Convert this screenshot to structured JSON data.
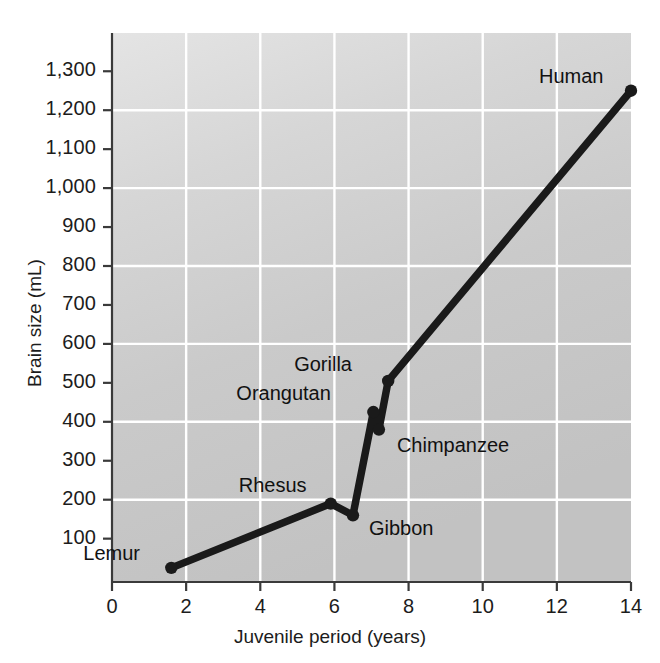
{
  "chart_data": {
    "type": "line",
    "title": "",
    "xlabel": "Juvenile period (years)",
    "ylabel": "Brain size (mL)",
    "xlim": [
      0,
      14
    ],
    "ylim": [
      0,
      1340
    ],
    "xticks": [
      0,
      2,
      4,
      6,
      8,
      10,
      12,
      14
    ],
    "xtick_labels": [
      "0",
      "2",
      "4",
      "6",
      "8",
      "10",
      "12",
      "14"
    ],
    "yticks": [
      100,
      200,
      300,
      400,
      500,
      600,
      700,
      800,
      900,
      1000,
      1100,
      1200,
      1300
    ],
    "ytick_labels": [
      "100",
      "200",
      "300",
      "400",
      "500",
      "600",
      "700",
      "800",
      "900",
      "1,000",
      "1,100",
      "1,200",
      "1,300"
    ],
    "grid": true,
    "grid_color": "#ffffff",
    "plot_background": "#c9c9c9",
    "line_color": "#1a1a1a",
    "marker_color": "#1a1a1a",
    "legend": "none",
    "points": [
      {
        "name": "Lemur",
        "x": 1.6,
        "y": 25,
        "label_dx": -88,
        "label_dy": -26
      },
      {
        "name": "Rhesus",
        "x": 5.9,
        "y": 190,
        "label_dx": -92,
        "label_dy": -30
      },
      {
        "name": "Gibbon",
        "x": 6.5,
        "y": 160,
        "label_dx": 16,
        "label_dy": 2
      },
      {
        "name": "Orangutan",
        "x": 7.05,
        "y": 425,
        "label_dx": -137,
        "label_dy": -30
      },
      {
        "name": "Chimpanzee",
        "x": 7.2,
        "y": 380,
        "label_dx": 18,
        "label_dy": 4
      },
      {
        "name": "Gorilla",
        "x": 7.45,
        "y": 505,
        "label_dx": -94,
        "label_dy": -28
      },
      {
        "name": "Human",
        "x": 14.0,
        "y": 1250,
        "label_dx": -92,
        "label_dy": -26
      }
    ],
    "series": [
      {
        "name": "brain size vs juvenile period",
        "x": [
          1.6,
          5.9,
          6.5,
          7.05,
          7.2,
          7.45,
          14.0
        ],
        "values": [
          25,
          190,
          160,
          425,
          380,
          505,
          1250
        ]
      }
    ]
  },
  "axes": {
    "x_title": "Juvenile period (years)",
    "y_title": "Brain size (mL)"
  }
}
